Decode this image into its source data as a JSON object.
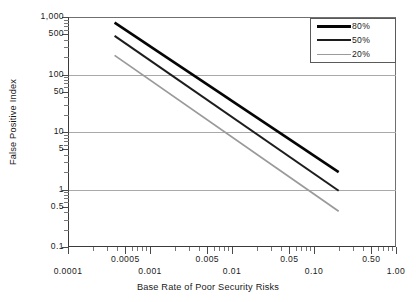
{
  "chart_data": {
    "type": "line",
    "title": "",
    "xlabel": "Base Rate of Poor Security Risks",
    "ylabel": "False Positive Index",
    "xscale": "log",
    "yscale": "log",
    "xlim": [
      0.0001,
      1.0
    ],
    "ylim": [
      0.1,
      1000
    ],
    "grid": true,
    "legend_position": "top-right",
    "x_tick_labels_major": [
      "0.0001",
      "0.001",
      "0.01",
      "0.10",
      "1.00"
    ],
    "x_tick_values_major": [
      0.0001,
      0.001,
      0.01,
      0.1,
      1.0
    ],
    "x_tick_labels_minor": [
      "0.0005",
      "0.005",
      "0.05",
      "0.50"
    ],
    "x_tick_values_minor": [
      0.0005,
      0.005,
      0.05,
      0.5
    ],
    "y_tick_labels": [
      "1,000",
      "500",
      "100",
      "50",
      "10",
      "5",
      "1",
      "0.5",
      "0.1"
    ],
    "y_tick_values": [
      1000,
      500,
      100,
      50,
      10,
      5,
      1,
      0.5,
      0.1
    ],
    "y_gridline_values": [
      1000,
      100,
      10,
      1
    ],
    "series": [
      {
        "name": "80%",
        "color": "#050505",
        "width": 2.6,
        "x": [
          0.00037,
          0.2
        ],
        "y": [
          800,
          2.0
        ]
      },
      {
        "name": "50%",
        "color": "#1c1c1c",
        "width": 2.0,
        "x": [
          0.00037,
          0.2
        ],
        "y": [
          470,
          0.95
        ]
      },
      {
        "name": "20%",
        "color": "#9a9a9a",
        "width": 1.8,
        "x": [
          0.00037,
          0.2
        ],
        "y": [
          215,
          0.42
        ]
      }
    ]
  },
  "legend": {
    "items": [
      {
        "label": "80%"
      },
      {
        "label": "50%"
      },
      {
        "label": "20%"
      }
    ]
  },
  "axes": {
    "x_title": "Base Rate of Poor Security Risks",
    "y_title": "False Positive Index"
  }
}
